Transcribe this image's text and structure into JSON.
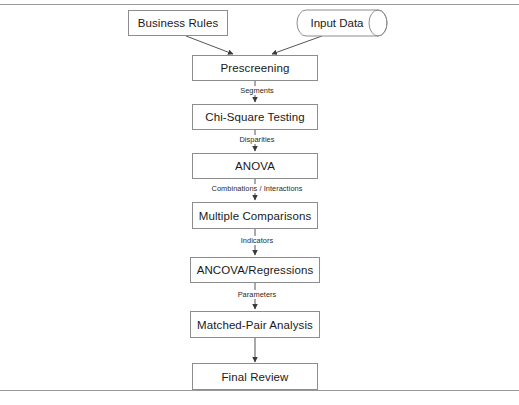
{
  "diagram": {
    "frame": {
      "top_rule": "horizontal-rule",
      "bottom_rule": "horizontal-rule",
      "rule_color": "#9a9a9a"
    },
    "style": {
      "node_border_color": "#8d8d8d",
      "node_fill": "#ffffff",
      "connector_color": "#555555",
      "text_color": "#1a1a1a"
    },
    "inputs": [
      {
        "id": "business-rules",
        "label": "Business Rules",
        "shape": "rectangle"
      },
      {
        "id": "input-data",
        "label": "Input Data",
        "shape": "cylinder"
      }
    ],
    "nodes": [
      {
        "id": "prescreening",
        "label": "Prescreening",
        "shape": "rectangle"
      },
      {
        "id": "chi-square-testing",
        "label": "Chi-Square Testing",
        "shape": "rectangle"
      },
      {
        "id": "anova",
        "label": "ANOVA",
        "shape": "rectangle"
      },
      {
        "id": "multiple-comparisons",
        "label": "Multiple Comparisons",
        "shape": "rectangle"
      },
      {
        "id": "ancova-regressions",
        "label": "ANCOVA/Regressions",
        "shape": "rectangle"
      },
      {
        "id": "matched-pair-analysis",
        "label": "Matched-Pair Analysis",
        "shape": "rectangle"
      },
      {
        "id": "final-review",
        "label": "Final Review",
        "shape": "rectangle"
      }
    ],
    "edge_labels": [
      {
        "id": "segments",
        "label": "Segments",
        "from": "prescreening",
        "to": "chi-square-testing"
      },
      {
        "id": "disparities",
        "label": "Disparities",
        "from": "chi-square-testing",
        "to": "anova"
      },
      {
        "id": "combinations-interactions",
        "label": "Combinations / Interactions",
        "from": "anova",
        "to": "multiple-comparisons"
      },
      {
        "id": "indicators",
        "label": "Indicators",
        "from": "multiple-comparisons",
        "to": "ancova-regressions"
      },
      {
        "id": "parameters",
        "label": "Parameters",
        "from": "ancova-regressions",
        "to": "matched-pair-analysis"
      },
      {
        "id": "final",
        "label": "",
        "from": "matched-pair-analysis",
        "to": "final-review"
      }
    ]
  }
}
